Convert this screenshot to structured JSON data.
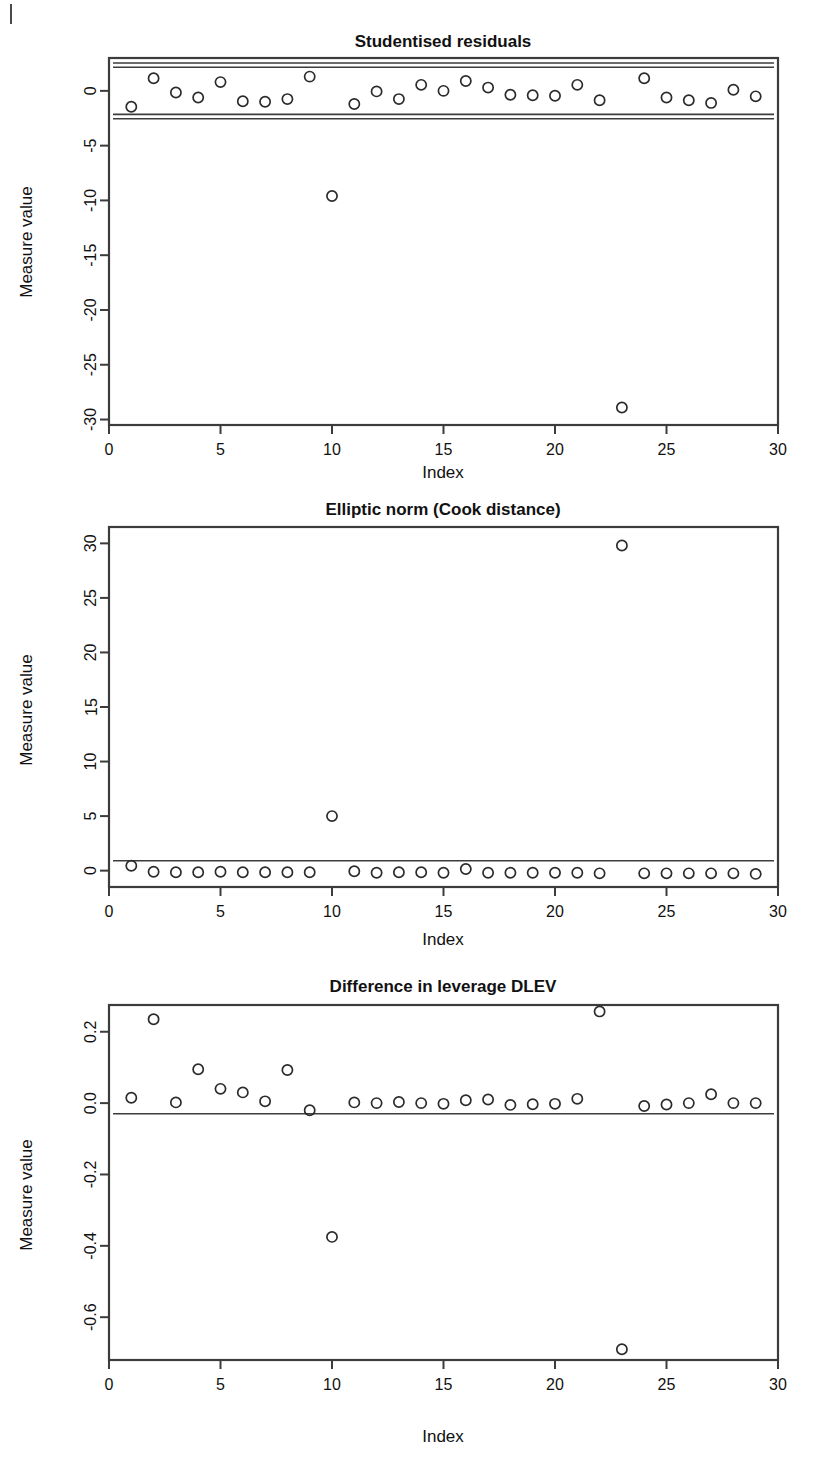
{
  "page": {
    "background_color": "#ffffff",
    "ink_color": "#2b2b2b",
    "corner_mark": "|"
  },
  "panels": [
    {
      "id": "studentised-residuals",
      "title": "Studentised residuals",
      "xlabel": "Index",
      "ylabel": "Measure value"
    },
    {
      "id": "elliptic-norm",
      "title": "Elliptic norm (Cook distance)",
      "xlabel": "Index",
      "ylabel": "Measure value"
    },
    {
      "id": "difference-in-leverage",
      "title": "Difference in leverage DLEV",
      "xlabel": "Index",
      "ylabel": "Measure value"
    }
  ],
  "chart_data": [
    {
      "type": "scatter",
      "title": "Studentised residuals",
      "xlabel": "Index",
      "ylabel": "Measure value",
      "xlim": [
        0,
        30
      ],
      "ylim": [
        -30.5,
        3.0
      ],
      "xticks": [
        0,
        5,
        10,
        15,
        20,
        25,
        30
      ],
      "xtick_labels": [
        "0",
        "5",
        "10",
        "15",
        "20",
        "25",
        "30"
      ],
      "yticks": [
        0,
        -5,
        -10,
        -15,
        -20,
        -25,
        -30
      ],
      "ytick_labels": [
        "0",
        "-5",
        "-10",
        "-15",
        "-20",
        "-25",
        "-30"
      ],
      "grid": false,
      "legend": null,
      "marker": "open-circle",
      "reference_lines": [
        {
          "y": 2.55,
          "style": "solid"
        },
        {
          "y": 2.15,
          "style": "solid"
        },
        {
          "y": -2.15,
          "style": "solid"
        },
        {
          "y": -2.55,
          "style": "solid"
        }
      ],
      "x": [
        1,
        2,
        3,
        4,
        5,
        6,
        7,
        8,
        9,
        10,
        11,
        12,
        13,
        14,
        15,
        16,
        17,
        18,
        19,
        20,
        21,
        22,
        23,
        24,
        25,
        26,
        27,
        28,
        29
      ],
      "values": [
        -1.45,
        1.15,
        -0.15,
        -0.6,
        0.8,
        -0.95,
        -1.0,
        -0.75,
        1.3,
        -9.6,
        -1.2,
        -0.05,
        -0.75,
        0.55,
        0.0,
        0.9,
        0.3,
        -0.35,
        -0.4,
        -0.45,
        0.55,
        -0.85,
        -28.9,
        1.15,
        -0.6,
        -0.85,
        -1.1,
        0.1,
        -0.5
      ]
    },
    {
      "type": "scatter",
      "title": "Elliptic norm (Cook distance)",
      "xlabel": "Index",
      "ylabel": "Measure value",
      "xlim": [
        0,
        30
      ],
      "ylim": [
        -1.5,
        31.5
      ],
      "xticks": [
        0,
        5,
        10,
        15,
        20,
        25,
        30
      ],
      "xtick_labels": [
        "0",
        "5",
        "10",
        "15",
        "20",
        "25",
        "30"
      ],
      "yticks": [
        0,
        5,
        10,
        15,
        20,
        25,
        30
      ],
      "ytick_labels": [
        "0",
        "5",
        "10",
        "15",
        "20",
        "25",
        "30"
      ],
      "grid": false,
      "legend": null,
      "marker": "open-circle",
      "reference_lines": [
        {
          "y": 0.9,
          "style": "solid"
        }
      ],
      "x": [
        1,
        2,
        3,
        4,
        5,
        6,
        7,
        8,
        9,
        10,
        11,
        12,
        13,
        14,
        15,
        16,
        17,
        18,
        19,
        20,
        21,
        22,
        23,
        24,
        25,
        26,
        27,
        28,
        29
      ],
      "values": [
        0.45,
        -0.1,
        -0.15,
        -0.15,
        -0.1,
        -0.15,
        -0.15,
        -0.15,
        -0.15,
        5.0,
        -0.05,
        -0.2,
        -0.15,
        -0.15,
        -0.2,
        0.15,
        -0.2,
        -0.2,
        -0.2,
        -0.2,
        -0.2,
        -0.25,
        29.8,
        -0.25,
        -0.25,
        -0.25,
        -0.25,
        -0.25,
        -0.3
      ]
    },
    {
      "type": "scatter",
      "title": "Difference in leverage DLEV",
      "xlabel": "Index",
      "ylabel": "Measure value",
      "xlim": [
        0,
        30
      ],
      "ylim": [
        -0.72,
        0.275
      ],
      "xticks": [
        0,
        5,
        10,
        15,
        20,
        25,
        30
      ],
      "xtick_labels": [
        "0",
        "5",
        "10",
        "15",
        "20",
        "25",
        "30"
      ],
      "yticks": [
        0.2,
        0.0,
        -0.2,
        -0.4,
        -0.6
      ],
      "ytick_labels": [
        "0.2",
        "0.0",
        "-0.2",
        "-0.4",
        "-0.6"
      ],
      "grid": false,
      "legend": null,
      "marker": "open-circle",
      "reference_lines": [
        {
          "y": -0.03,
          "style": "solid"
        }
      ],
      "x": [
        1,
        2,
        3,
        4,
        5,
        6,
        7,
        8,
        9,
        10,
        11,
        12,
        13,
        14,
        15,
        16,
        17,
        18,
        19,
        20,
        21,
        22,
        23,
        24,
        25,
        26,
        27,
        28,
        29
      ],
      "values": [
        0.015,
        0.235,
        0.002,
        0.095,
        0.04,
        0.03,
        0.005,
        0.093,
        -0.02,
        -0.375,
        0.002,
        0.0,
        0.003,
        0.0,
        -0.002,
        0.008,
        0.01,
        -0.005,
        -0.003,
        -0.002,
        0.012,
        0.257,
        -0.69,
        -0.008,
        -0.004,
        0.0,
        0.025,
        0.0,
        0.0
      ]
    }
  ]
}
